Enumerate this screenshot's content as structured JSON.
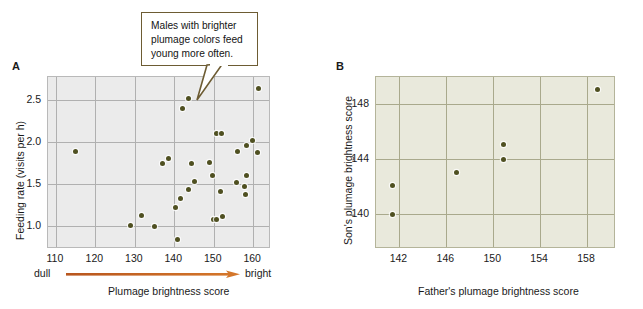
{
  "figure": {
    "panels": [
      {
        "letter": "A",
        "callout": "Males with brighter plumage colors feed young more often.",
        "xlabel": "Plumage brightness score",
        "ylabel": "Feeding rate (visits per h)",
        "x_low_label": "dull",
        "x_high_label": "bright",
        "arrow_color": "#c1591f"
      },
      {
        "letter": "B",
        "callout": "Males with bright plumage coloration tend to produce sons with bright plumage. This is likely a result of both fathers and sons having similar foraging skills.",
        "xlabel": "Father's plumage brightness score",
        "ylabel": "Son's plumage brightness score"
      }
    ]
  },
  "chart_data": [
    {
      "type": "scatter",
      "panel": "A",
      "title": "",
      "xlabel": "Plumage brightness score",
      "ylabel": "Feeding rate (visits per h)",
      "xlim": [
        108,
        164
      ],
      "ylim": [
        0.75,
        2.78
      ],
      "xticks": [
        110,
        120,
        130,
        140,
        150,
        160
      ],
      "yticks": [
        1.0,
        1.5,
        2.0,
        2.5
      ],
      "xtick_labels": [
        "110",
        "120",
        "130",
        "140",
        "150",
        "160"
      ],
      "ytick_labels": [
        "1.0",
        "1.5",
        "2.0",
        "2.5"
      ],
      "x_axis_low_annotation": "dull",
      "x_axis_high_annotation": "bright",
      "grid": true,
      "legend": "none",
      "marker_color": "#4f5021",
      "background": "#ebebeb",
      "points": [
        {
          "x": 114.9,
          "y": 1.89
        },
        {
          "x": 128.8,
          "y": 1.01
        },
        {
          "x": 131.6,
          "y": 1.13
        },
        {
          "x": 135.0,
          "y": 0.99
        },
        {
          "x": 137.0,
          "y": 1.75
        },
        {
          "x": 138.6,
          "y": 1.81
        },
        {
          "x": 140.2,
          "y": 1.22
        },
        {
          "x": 140.9,
          "y": 0.84
        },
        {
          "x": 141.6,
          "y": 1.33
        },
        {
          "x": 142.2,
          "y": 2.4
        },
        {
          "x": 143.6,
          "y": 2.52
        },
        {
          "x": 143.7,
          "y": 1.44
        },
        {
          "x": 144.4,
          "y": 1.75
        },
        {
          "x": 145.0,
          "y": 1.53
        },
        {
          "x": 148.9,
          "y": 1.76
        },
        {
          "x": 149.7,
          "y": 1.6
        },
        {
          "x": 150.0,
          "y": 1.08
        },
        {
          "x": 150.6,
          "y": 1.08
        },
        {
          "x": 150.7,
          "y": 2.1
        },
        {
          "x": 151.6,
          "y": 1.41
        },
        {
          "x": 152.0,
          "y": 2.11
        },
        {
          "x": 152.1,
          "y": 1.12
        },
        {
          "x": 155.8,
          "y": 1.52
        },
        {
          "x": 156.0,
          "y": 1.89
        },
        {
          "x": 157.7,
          "y": 1.47
        },
        {
          "x": 158.0,
          "y": 1.38
        },
        {
          "x": 158.3,
          "y": 1.6
        },
        {
          "x": 158.4,
          "y": 1.96
        },
        {
          "x": 159.9,
          "y": 2.02
        },
        {
          "x": 161.0,
          "y": 1.88
        },
        {
          "x": 161.3,
          "y": 2.64
        }
      ]
    },
    {
      "type": "scatter",
      "panel": "B",
      "title": "",
      "xlabel": "Father's plumage brightness score",
      "ylabel": "Son's plumage brightness score",
      "xlim": [
        140.0,
        160.3
      ],
      "ylim": [
        137.6,
        150.0
      ],
      "xticks": [
        142,
        146,
        150,
        154,
        158
      ],
      "yticks": [
        140,
        144,
        148
      ],
      "xtick_labels": [
        "142",
        "146",
        "150",
        "154",
        "158"
      ],
      "ytick_labels": [
        "140",
        "144",
        "148"
      ],
      "grid": true,
      "legend": "none",
      "marker_color": "#4f5021",
      "background": "#e9e9dc",
      "points": [
        {
          "x": 141.4,
          "y": 140.0
        },
        {
          "x": 141.4,
          "y": 142.1
        },
        {
          "x": 146.9,
          "y": 143.0
        },
        {
          "x": 150.9,
          "y": 144.0
        },
        {
          "x": 150.9,
          "y": 145.1
        },
        {
          "x": 158.9,
          "y": 149.1
        }
      ]
    }
  ]
}
